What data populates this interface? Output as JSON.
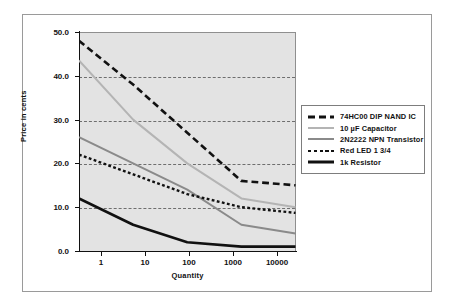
{
  "chart_data": {
    "type": "line",
    "title": "",
    "subtitle": "",
    "xlabel": "Quantity",
    "ylabel": "Price in cents",
    "categories": [
      "1",
      "10",
      "100",
      "1000",
      "10000"
    ],
    "xscale": "log",
    "xlim": [
      1,
      10000
    ],
    "ylim": [
      0.0,
      50.0
    ],
    "yticks": [
      "0.0",
      "10.0",
      "20.0",
      "30.0",
      "40.0",
      "50.0"
    ],
    "ytick_values": [
      0.0,
      10.0,
      20.0,
      30.0,
      40.0,
      50.0
    ],
    "grid": "horizontal-dashed",
    "legend_position": "right",
    "plot_background": "#e3e3e3",
    "series": [
      {
        "name": "74HC00 DIP NAND IC",
        "values": [
          48.0,
          38.0,
          27.0,
          16.0,
          15.0
        ],
        "color": "#111111",
        "style": "long-dash",
        "width": 2.6
      },
      {
        "name": "10 µF Capacitor",
        "values": [
          43.5,
          30.0,
          20.0,
          12.0,
          10.0
        ],
        "color": "#b4b4b4",
        "style": "solid",
        "width": 2.0
      },
      {
        "name": "2N2222 NPN Transistor",
        "values": [
          26.0,
          20.0,
          14.0,
          6.0,
          4.0
        ],
        "color": "#8a8a8a",
        "style": "solid",
        "width": 2.0
      },
      {
        "name": "Red LED 1 3/4",
        "values": [
          22.0,
          17.5,
          13.0,
          10.0,
          8.7
        ],
        "color": "#111111",
        "style": "short-dash",
        "width": 2.4
      },
      {
        "name": "1k Resistor",
        "values": [
          12.0,
          6.0,
          2.0,
          1.0,
          1.0
        ],
        "color": "#111111",
        "style": "solid",
        "width": 2.6
      }
    ]
  },
  "legend": {
    "items": [
      {
        "label": "74HC00 DIP NAND IC"
      },
      {
        "label": "10 µF Capacitor"
      },
      {
        "label": "2N2222 NPN Transistor"
      },
      {
        "label": "Red LED 1 3/4"
      },
      {
        "label": "1k Resistor"
      }
    ]
  }
}
